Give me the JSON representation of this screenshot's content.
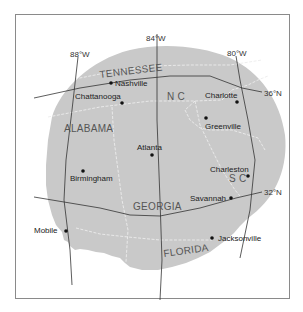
{
  "map": {
    "title": "",
    "colors": {
      "background": "#ffffff",
      "land": "#c9c9c9",
      "frame": "#8a8a8a",
      "graticule": "#333333",
      "state_border": "#ececec",
      "text": "#222222",
      "state_text": "#555555"
    },
    "meridians": [
      {
        "label": "88°W"
      },
      {
        "label": "84°W"
      },
      {
        "label": "80°W"
      }
    ],
    "parallels": [
      {
        "label": "36°N"
      },
      {
        "label": "32°N"
      }
    ],
    "states": [
      {
        "label": "TENNESSEE"
      },
      {
        "label": "N C"
      },
      {
        "label": "ALABAMA"
      },
      {
        "label": "S C"
      },
      {
        "label": "GEORGIA"
      },
      {
        "label": "FLORIDA"
      }
    ],
    "cities": [
      {
        "name": "Nashville"
      },
      {
        "name": "Chattanooga"
      },
      {
        "name": "Charlotte"
      },
      {
        "name": "Greenville"
      },
      {
        "name": "Atlanta"
      },
      {
        "name": "Birmingham"
      },
      {
        "name": "Charleston"
      },
      {
        "name": "Savannah"
      },
      {
        "name": "Mobile"
      },
      {
        "name": "Jacksonville"
      }
    ]
  }
}
